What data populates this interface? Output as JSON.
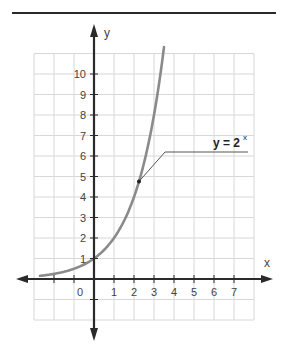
{
  "chart_data": {
    "type": "line",
    "title": "",
    "function": "y = 2^x",
    "xlabel": "x",
    "ylabel": "y",
    "xlim": [
      -3,
      8
    ],
    "ylim": [
      -2,
      11
    ],
    "grid": true,
    "x_tick_labels": [
      "0",
      "1",
      "2",
      "3",
      "4",
      "5",
      "6",
      "7"
    ],
    "y_tick_labels": [
      "1",
      "2",
      "3",
      "4",
      "5",
      "6",
      "7",
      "8",
      "9",
      "10"
    ],
    "series": [
      {
        "name": "y = 2^x",
        "x": [
          -2.7,
          -2,
          -1,
          0,
          1,
          2,
          2.25,
          3,
          3.5
        ],
        "values": [
          0.15,
          0.25,
          0.5,
          1,
          2,
          4,
          4.76,
          8,
          11.3
        ]
      }
    ],
    "annotations": [
      {
        "text": "y = 2",
        "superscript": "x",
        "point": [
          2.25,
          4.76
        ]
      }
    ]
  },
  "labels": {
    "x_axis": "x",
    "y_axis": "y",
    "equation_base": "y =  2",
    "equation_exp": "x"
  },
  "colors": {
    "axis": "#2a2a2a",
    "grid": "#d8d8d8",
    "curve": "#8a8a8a",
    "text": "#444444"
  }
}
